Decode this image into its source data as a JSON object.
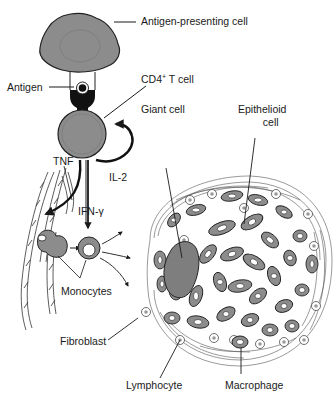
{
  "diagram": {
    "colors": {
      "cell_fill": "#8c8c8c",
      "cell_stroke": "#222222",
      "line": "#1a1a1a",
      "background": "#ffffff",
      "lymphocyte_core": "#9a9a9a"
    },
    "labels": {
      "apc": "Antigen-presenting cell",
      "antigen": "Antigen",
      "cd4_main": "CD4",
      "cd4_sup": "+",
      "cd4_rest": " T cell",
      "giant_cell": "Giant cell",
      "epithelioid_line1": "Epithelioid",
      "epithelioid_line2": "cell",
      "tnf": "TNF",
      "il2": "IL-2",
      "ifn": "IFN-γ",
      "monocytes": "Monocytes",
      "fibroblast": "Fibroblast",
      "lymphocyte": "Lymphocyte",
      "macrophage": "Macrophage"
    },
    "nodes": [
      {
        "id": "apc",
        "name": "Antigen-presenting cell"
      },
      {
        "id": "antigen",
        "name": "Antigen"
      },
      {
        "id": "cd4",
        "name": "CD4+ T cell"
      },
      {
        "id": "monocytes",
        "name": "Monocytes"
      },
      {
        "id": "granuloma",
        "name": "Granuloma",
        "contains": [
          "Giant cell",
          "Epithelioid cell",
          "Lymphocyte",
          "Macrophage",
          "Fibroblast"
        ]
      }
    ],
    "edges": [
      {
        "from": "cd4",
        "to": "cd4",
        "label": "IL-2"
      },
      {
        "from": "cd4",
        "to": "blood vessel",
        "label": "TNF"
      },
      {
        "from": "cd4",
        "to": "monocytes",
        "label": "IFN-γ"
      },
      {
        "from": "monocytes",
        "to": "granuloma",
        "label": ""
      }
    ]
  }
}
